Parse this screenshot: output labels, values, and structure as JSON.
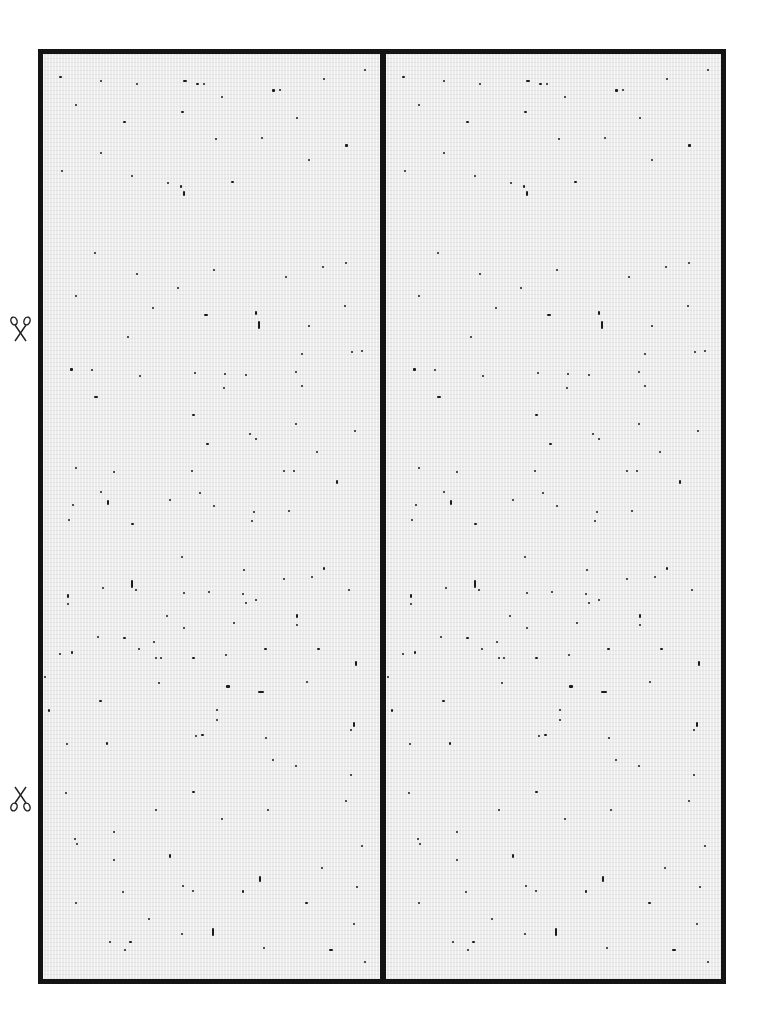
{
  "sheet": {
    "type": "printable-card-template",
    "panels": 2,
    "frame_color": "#141414",
    "background_color": "#ececec",
    "speck_color": "#1a1a1a"
  },
  "cut_marks": [
    {
      "name": "scissors-top",
      "top": 316
    },
    {
      "name": "scissors-bottom",
      "top": 786
    }
  ],
  "dots": [
    [
      16,
      22,
      3,
      2
    ],
    [
      57,
      26,
      2,
      2
    ],
    [
      93,
      29,
      2,
      2
    ],
    [
      153,
      29,
      3,
      2
    ],
    [
      160,
      29,
      2,
      2
    ],
    [
      229,
      35,
      3,
      3
    ],
    [
      236,
      35,
      2,
      2
    ],
    [
      321,
      15,
      2,
      2
    ],
    [
      280,
      24,
      2,
      2
    ],
    [
      32,
      50,
      2,
      2
    ],
    [
      178,
      42,
      2,
      2
    ],
    [
      140,
      26,
      4,
      2
    ],
    [
      80,
      67,
      3,
      2
    ],
    [
      138,
      57,
      3,
      2
    ],
    [
      218,
      83,
      2,
      2
    ],
    [
      253,
      63,
      2,
      2
    ],
    [
      302,
      90,
      3,
      3
    ],
    [
      265,
      105,
      2,
      2
    ],
    [
      172,
      84,
      2,
      2
    ],
    [
      18,
      116,
      2,
      2
    ],
    [
      57,
      98,
      2,
      2
    ],
    [
      124,
      128,
      2,
      2
    ],
    [
      88,
      121,
      2,
      2
    ],
    [
      137,
      131,
      2,
      3
    ],
    [
      188,
      127,
      3,
      2
    ],
    [
      140,
      137,
      2,
      5
    ],
    [
      51,
      198,
      2,
      2
    ],
    [
      93,
      219,
      2,
      2
    ],
    [
      134,
      233,
      2,
      2
    ],
    [
      170,
      215,
      2,
      2
    ],
    [
      242,
      222,
      2,
      2
    ],
    [
      279,
      212,
      2,
      2
    ],
    [
      302,
      208,
      2,
      2
    ],
    [
      32,
      241,
      2,
      2
    ],
    [
      109,
      253,
      2,
      2
    ],
    [
      161,
      260,
      4,
      2
    ],
    [
      212,
      257,
      2,
      4
    ],
    [
      215,
      267,
      2,
      8
    ],
    [
      265,
      271,
      2,
      2
    ],
    [
      301,
      251,
      2,
      2
    ],
    [
      84,
      282,
      2,
      2
    ],
    [
      258,
      299,
      2,
      2
    ],
    [
      308,
      297,
      2,
      2
    ],
    [
      318,
      296,
      2,
      2
    ],
    [
      27,
      314,
      3,
      3
    ],
    [
      48,
      315,
      2,
      2
    ],
    [
      96,
      321,
      2,
      2
    ],
    [
      181,
      319,
      2,
      2
    ],
    [
      151,
      318,
      2,
      2
    ],
    [
      202,
      320,
      2,
      2
    ],
    [
      252,
      317,
      2,
      2
    ],
    [
      258,
      331,
      2,
      2
    ],
    [
      180,
      333,
      2,
      2
    ],
    [
      51,
      342,
      4,
      2
    ],
    [
      149,
      360,
      3,
      2
    ],
    [
      252,
      369,
      2,
      2
    ],
    [
      206,
      379,
      2,
      2
    ],
    [
      212,
      384,
      2,
      2
    ],
    [
      311,
      376,
      2,
      2
    ],
    [
      273,
      397,
      2,
      2
    ],
    [
      163,
      389,
      3,
      2
    ],
    [
      32,
      413,
      2,
      2
    ],
    [
      70,
      417,
      2,
      2
    ],
    [
      148,
      416,
      2,
      2
    ],
    [
      240,
      416,
      2,
      2
    ],
    [
      250,
      416,
      2,
      2
    ],
    [
      293,
      426,
      2,
      4
    ],
    [
      57,
      437,
      2,
      2
    ],
    [
      156,
      438,
      2,
      2
    ],
    [
      29,
      450,
      2,
      2
    ],
    [
      64,
      446,
      2,
      5
    ],
    [
      126,
      445,
      2,
      2
    ],
    [
      170,
      451,
      2,
      2
    ],
    [
      210,
      457,
      2,
      2
    ],
    [
      245,
      456,
      2,
      2
    ],
    [
      25,
      465,
      2,
      2
    ],
    [
      88,
      469,
      3,
      2
    ],
    [
      208,
      466,
      2,
      2
    ],
    [
      138,
      502,
      2,
      2
    ],
    [
      280,
      513,
      2,
      3
    ],
    [
      200,
      515,
      2,
      2
    ],
    [
      240,
      524,
      2,
      2
    ],
    [
      268,
      522,
      2,
      2
    ],
    [
      88,
      526,
      2,
      8
    ],
    [
      140,
      538,
      2,
      2
    ],
    [
      165,
      537,
      2,
      2
    ],
    [
      212,
      545,
      2,
      2
    ],
    [
      253,
      560,
      2,
      4
    ],
    [
      190,
      568,
      2,
      2
    ],
    [
      253,
      570,
      2,
      2
    ],
    [
      59,
      533,
      2,
      2
    ],
    [
      92,
      535,
      2,
      2
    ],
    [
      305,
      535,
      2,
      2
    ],
    [
      24,
      540,
      2,
      4
    ],
    [
      24,
      549,
      2,
      2
    ],
    [
      199,
      539,
      2,
      2
    ],
    [
      202,
      548,
      2,
      2
    ],
    [
      123,
      561,
      2,
      2
    ],
    [
      140,
      573,
      2,
      2
    ],
    [
      16,
      599,
      2,
      2
    ],
    [
      54,
      582,
      2,
      2
    ],
    [
      80,
      583,
      3,
      2
    ],
    [
      110,
      587,
      2,
      2
    ],
    [
      95,
      594,
      2,
      2
    ],
    [
      28,
      597,
      2,
      3
    ],
    [
      112,
      603,
      2,
      2
    ],
    [
      117,
      603,
      2,
      2
    ],
    [
      149,
      603,
      3,
      2
    ],
    [
      182,
      600,
      2,
      2
    ],
    [
      221,
      594,
      3,
      2
    ],
    [
      274,
      594,
      3,
      2
    ],
    [
      312,
      607,
      2,
      5
    ],
    [
      1,
      622,
      2,
      2
    ],
    [
      115,
      628,
      2,
      2
    ],
    [
      183,
      631,
      4,
      3
    ],
    [
      215,
      637,
      6,
      2
    ],
    [
      263,
      627,
      2,
      2
    ],
    [
      56,
      646,
      3,
      2
    ],
    [
      5,
      655,
      2,
      3
    ],
    [
      173,
      655,
      2,
      2
    ],
    [
      173,
      665,
      2,
      2
    ],
    [
      152,
      681,
      2,
      2
    ],
    [
      158,
      680,
      3,
      2
    ],
    [
      222,
      683,
      2,
      2
    ],
    [
      23,
      689,
      2,
      2
    ],
    [
      63,
      688,
      2,
      3
    ],
    [
      310,
      668,
      2,
      5
    ],
    [
      307,
      675,
      2,
      2
    ],
    [
      229,
      705,
      2,
      2
    ],
    [
      252,
      711,
      2,
      2
    ],
    [
      307,
      720,
      2,
      2
    ],
    [
      22,
      738,
      2,
      2
    ],
    [
      149,
      737,
      3,
      2
    ],
    [
      112,
      755,
      2,
      2
    ],
    [
      178,
      764,
      2,
      2
    ],
    [
      224,
      755,
      2,
      2
    ],
    [
      302,
      746,
      2,
      2
    ],
    [
      70,
      777,
      2,
      2
    ],
    [
      31,
      784,
      2,
      2
    ],
    [
      33,
      789,
      2,
      2
    ],
    [
      70,
      805,
      2,
      2
    ],
    [
      126,
      800,
      2,
      4
    ],
    [
      318,
      791,
      2,
      2
    ],
    [
      278,
      813,
      2,
      2
    ],
    [
      216,
      822,
      2,
      6
    ],
    [
      79,
      837,
      2,
      2
    ],
    [
      139,
      831,
      2,
      2
    ],
    [
      149,
      836,
      2,
      2
    ],
    [
      199,
      836,
      2,
      3
    ],
    [
      313,
      832,
      2,
      2
    ],
    [
      32,
      848,
      2,
      2
    ],
    [
      262,
      848,
      3,
      2
    ],
    [
      105,
      864,
      2,
      2
    ],
    [
      310,
      869,
      2,
      2
    ],
    [
      138,
      879,
      2,
      2
    ],
    [
      169,
      874,
      2,
      8
    ],
    [
      66,
      887,
      2,
      2
    ],
    [
      86,
      887,
      3,
      2
    ],
    [
      81,
      895,
      2,
      2
    ],
    [
      220,
      893,
      2,
      2
    ],
    [
      286,
      895,
      4,
      2
    ],
    [
      321,
      907,
      2,
      2
    ]
  ]
}
